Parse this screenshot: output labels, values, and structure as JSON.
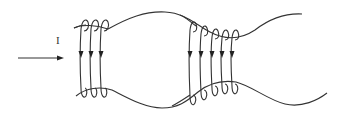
{
  "diagram": {
    "type": "current-carrying coils around a flux tube (magnetic bottle)",
    "current_label": "I",
    "colors": {
      "stroke": "#333333",
      "background": "#ffffff"
    },
    "current_arrow": {
      "from": [
        18,
        58
      ],
      "to": [
        63,
        58
      ],
      "direction": "right"
    },
    "outer_boundary": {
      "upper_curve": "upper field line, narrow at coils, bulging upward between coil groups",
      "lower_curve": "lower field line, mirror of upper"
    },
    "coil_groups": [
      {
        "name": "left-coil-group",
        "count": 3,
        "x_positions": [
          81,
          91,
          101
        ],
        "current_direction": "down"
      },
      {
        "name": "right-coil-group",
        "count": 5,
        "x_positions": [
          190,
          201,
          212,
          222,
          232
        ],
        "current_direction": "down"
      }
    ]
  }
}
